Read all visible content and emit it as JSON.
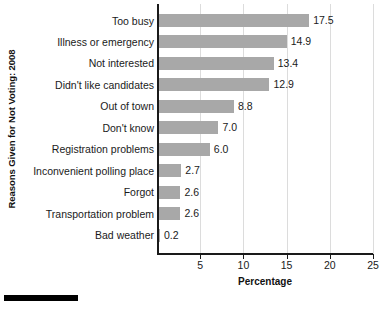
{
  "chart_data": {
    "type": "bar",
    "orientation": "horizontal",
    "title": "",
    "subtitle": "",
    "xlabel": "Percentage",
    "ylabel": "Reasons Given for Not Voting: 2008",
    "categories": [
      "Too busy",
      "Illness or emergency",
      "Not interested",
      "Didn't like candidates",
      "Out of town",
      "Don't know",
      "Registration problems",
      "Inconvenient polling place",
      "Forgot",
      "Transportation problem",
      "Bad weather"
    ],
    "values": [
      17.5,
      14.9,
      13.4,
      12.9,
      8.8,
      7.0,
      6.0,
      2.7,
      2.6,
      2.6,
      0.2
    ],
    "value_labels": [
      "17.5",
      "14.9",
      "13.4",
      "12.9",
      "8.8",
      "7.0",
      "6.0",
      "2.7",
      "2.6",
      "2.6",
      "0.2"
    ],
    "xlim": [
      0,
      25
    ],
    "xticks": [
      5,
      10,
      15,
      20,
      25
    ],
    "xtick_labels": [
      "5",
      "10",
      "15",
      "20",
      "25"
    ],
    "grid": "vertical",
    "legend": "none",
    "bar_color": "#a8a8a8",
    "axis_color": "#1a1a1a",
    "gridline_color": "#dcdcdc"
  }
}
